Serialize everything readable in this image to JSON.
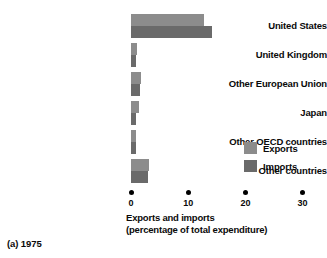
{
  "chart_data": {
    "type": "bar",
    "orientation": "horizontal",
    "title": "",
    "xlabel_line1": "Exports and imports",
    "xlabel_line2": "(percentage of total expenditure)",
    "ylabel": "",
    "categories": [
      "United States",
      "United Kingdom",
      "Other European Union",
      "Japan",
      "Other OECD countries",
      "Other countries"
    ],
    "series": [
      {
        "name": "Exports",
        "color": "#8c8c8c",
        "values": [
          12.8,
          1.0,
          1.7,
          1.4,
          0.8,
          3.1
        ]
      },
      {
        "name": "Imports",
        "color": "#6a6a6a",
        "values": [
          14.2,
          0.9,
          1.6,
          0.9,
          0.9,
          2.9
        ]
      }
    ],
    "xlim": [
      0,
      30
    ],
    "xticks": [
      0,
      10,
      20,
      30
    ],
    "xtick_labels": [
      "0",
      "10",
      "20",
      "30"
    ],
    "grid": false,
    "legend_position": "middle-right",
    "legend_entries": [
      "Exports",
      "Imports"
    ]
  },
  "caption": "(a) 1975"
}
